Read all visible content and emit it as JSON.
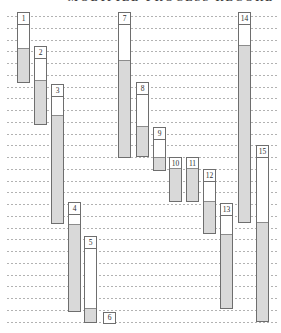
{
  "title": "MODIFIED PROCESS RECORD",
  "canvas": {
    "width": 281,
    "height": 333,
    "background": "#ffffff"
  },
  "chart_data": {
    "type": "bar",
    "subtype": "vertical-gantt-process-chart",
    "title": "MODIFIED PROCESS RECORD",
    "xlabel": "",
    "ylabel": "",
    "axis_note": "time flows downward; unlabeled dashed horizontal gridlines mark equal time intervals; no numeric axis labels are printed",
    "legend": "none",
    "grid": {
      "on": true,
      "first_y": 16,
      "spacing": 11.75,
      "count": 27,
      "x_start": 7,
      "x_end": 278,
      "color": "#b2b2b2"
    },
    "bar_width": 13,
    "label_box_height": 11,
    "colors": {
      "outline": "#6e6e6e",
      "idle_fill": "#ffffff",
      "work_fill": "#d9d9d9",
      "work_divider": "#8c8c8c"
    },
    "bars": [
      {
        "label": "1",
        "x": 17,
        "top_y": 12,
        "fill_start_y": 49,
        "bottom_y": 83
      },
      {
        "label": "2",
        "x": 34,
        "top_y": 46,
        "fill_start_y": 81,
        "bottom_y": 125
      },
      {
        "label": "3",
        "x": 51,
        "top_y": 84,
        "fill_start_y": 116,
        "bottom_y": 224
      },
      {
        "label": "4",
        "x": 68,
        "top_y": 202,
        "fill_start_y": 225,
        "bottom_y": 312
      },
      {
        "label": "5",
        "x": 84,
        "top_y": 236,
        "fill_start_y": 309,
        "bottom_y": 323
      },
      {
        "label": "6",
        "x": 103,
        "top_y": 312,
        "fill_start_y": 324,
        "bottom_y": 324
      },
      {
        "label": "7",
        "x": 118,
        "top_y": 12,
        "fill_start_y": 61,
        "bottom_y": 158
      },
      {
        "label": "8",
        "x": 136,
        "top_y": 82,
        "fill_start_y": 127,
        "bottom_y": 157
      },
      {
        "label": "9",
        "x": 153,
        "top_y": 127,
        "fill_start_y": 158,
        "bottom_y": 171
      },
      {
        "label": "10",
        "x": 169,
        "top_y": 157,
        "fill_start_y": 169,
        "bottom_y": 202
      },
      {
        "label": "11",
        "x": 186,
        "top_y": 157,
        "fill_start_y": 169,
        "bottom_y": 202
      },
      {
        "label": "12",
        "x": 203,
        "top_y": 169,
        "fill_start_y": 202,
        "bottom_y": 234
      },
      {
        "label": "13",
        "x": 220,
        "top_y": 203,
        "fill_start_y": 235,
        "bottom_y": 309
      },
      {
        "label": "14",
        "x": 238,
        "top_y": 12,
        "fill_start_y": 46,
        "bottom_y": 223
      },
      {
        "label": "15",
        "x": 256,
        "top_y": 145,
        "fill_start_y": 223,
        "bottom_y": 322
      }
    ]
  }
}
